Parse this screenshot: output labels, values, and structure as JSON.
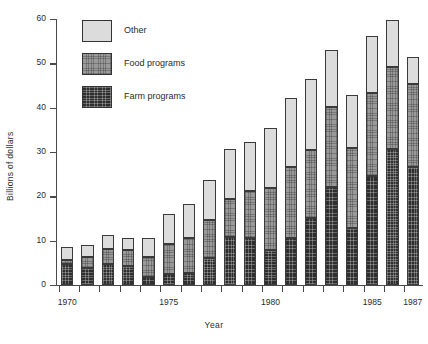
{
  "chart_data": {
    "type": "bar",
    "subtype": "stacked-vertical",
    "title": "",
    "xlabel": "Year",
    "ylabel": "Billions of dollars",
    "ylim": [
      0,
      60
    ],
    "ytick_values": [
      0,
      10,
      20,
      30,
      40,
      50,
      60
    ],
    "ytick_labels": [
      "0",
      "10",
      "20",
      "30",
      "40",
      "50",
      "60"
    ],
    "grid": false,
    "legend_position": "upper-left-inside",
    "categories": [
      "1970",
      "1971",
      "1972",
      "1973",
      "1974",
      "1975",
      "1976",
      "1977",
      "1978",
      "1979",
      "1980",
      "1981",
      "1982",
      "1983",
      "1984",
      "1985",
      "1986",
      "1987"
    ],
    "xtick_labeled": [
      "1970",
      "1975",
      "1980",
      "1985",
      "1987"
    ],
    "series": [
      {
        "name": "Farm programs",
        "color": "#2e2e2e",
        "values": [
          4.8,
          3.9,
          4.8,
          4.4,
          1.8,
          2.5,
          2.6,
          6.2,
          10.9,
          10.5,
          7.9,
          10.6,
          15.1,
          22.0,
          12.8,
          24.7,
          30.6,
          26.6
        ]
      },
      {
        "name": "Food programs",
        "color": "#9a9a9a",
        "values": [
          0.9,
          2.4,
          3.3,
          3.4,
          4.5,
          6.7,
          8.0,
          8.5,
          8.6,
          10.7,
          14.0,
          16.1,
          15.4,
          18.2,
          18.1,
          18.6,
          18.6,
          18.8
        ]
      },
      {
        "name": "Other",
        "color": "#dcdcdc",
        "values": [
          2.9,
          2.7,
          3.2,
          2.7,
          4.4,
          6.9,
          7.6,
          9.0,
          11.2,
          11.0,
          13.5,
          15.5,
          15.9,
          12.9,
          11.9,
          12.9,
          10.5,
          6.1
        ]
      }
    ],
    "totals": [
      8.6,
      9.0,
      11.3,
      10.5,
      10.7,
      16.1,
      18.2,
      23.7,
      30.7,
      32.2,
      35.4,
      42.2,
      46.4,
      53.1,
      42.8,
      56.2,
      59.7,
      51.5
    ]
  },
  "legend": {
    "items": [
      {
        "label": "Other",
        "swatch": "other-swatch"
      },
      {
        "label": "Food programs",
        "swatch": "food-swatch"
      },
      {
        "label": "Farm programs",
        "swatch": "farm-swatch"
      }
    ]
  },
  "axes": {
    "y_title": "Billions of dollars",
    "x_title": "Year"
  }
}
